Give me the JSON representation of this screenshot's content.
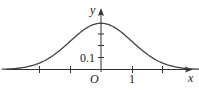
{
  "chart_data": {
    "type": "line",
    "title": "",
    "xlabel": "x",
    "ylabel": "y",
    "origin_label": "O",
    "x_tick_labels": [
      {
        "value": 1,
        "label": "1"
      }
    ],
    "y_tick_labels": [
      {
        "value": 0.1,
        "label": "0.1"
      }
    ],
    "x_ticks": [
      -2,
      -1,
      1,
      2
    ],
    "y_ticks": [
      0.1,
      0.2,
      0.3
    ],
    "xlim": [
      -3.2,
      3.2
    ],
    "ylim": [
      0,
      0.45
    ],
    "grid": false,
    "series": [
      {
        "name": "standard normal density",
        "x": [
          -3.2,
          -3,
          -2.5,
          -2,
          -1.5,
          -1,
          -0.5,
          0,
          0.5,
          1,
          1.5,
          2,
          2.5,
          3,
          3.2
        ],
        "values": [
          0.002,
          0.004,
          0.018,
          0.054,
          0.13,
          0.242,
          0.352,
          0.399,
          0.352,
          0.242,
          0.13,
          0.054,
          0.018,
          0.004,
          0.002
        ]
      }
    ],
    "color": "#333333"
  }
}
